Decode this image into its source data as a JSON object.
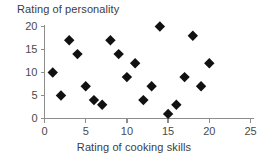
{
  "chart_data": {
    "type": "scatter",
    "title": "",
    "xlabel": "Rating of cooking skills",
    "ylabel": "Rating of personality",
    "xlim": [
      0,
      25
    ],
    "ylim": [
      0,
      20
    ],
    "xticks": [
      0,
      5,
      10,
      15,
      20,
      25
    ],
    "yticks": [
      0,
      5,
      10,
      15,
      20
    ],
    "grid": false,
    "legend": false,
    "marker": "diamond",
    "marker_color": "#111111",
    "axis_color": "#8d8d8d",
    "points": [
      {
        "x": 1,
        "y": 10
      },
      {
        "x": 2,
        "y": 5
      },
      {
        "x": 3,
        "y": 17
      },
      {
        "x": 4,
        "y": 14
      },
      {
        "x": 5,
        "y": 7
      },
      {
        "x": 6,
        "y": 4
      },
      {
        "x": 7,
        "y": 3
      },
      {
        "x": 8,
        "y": 17
      },
      {
        "x": 9,
        "y": 14
      },
      {
        "x": 10,
        "y": 9
      },
      {
        "x": 11,
        "y": 12
      },
      {
        "x": 12,
        "y": 4
      },
      {
        "x": 13,
        "y": 7
      },
      {
        "x": 14,
        "y": 20
      },
      {
        "x": 15,
        "y": 1
      },
      {
        "x": 16,
        "y": 3
      },
      {
        "x": 17,
        "y": 9
      },
      {
        "x": 18,
        "y": 18
      },
      {
        "x": 19,
        "y": 7
      },
      {
        "x": 20,
        "y": 12
      }
    ]
  },
  "labels": {
    "y_axis_title": "Rating of personality",
    "x_axis_title": "Rating of cooking skills",
    "y_ticks": [
      "0",
      "5",
      "10",
      "15",
      "20"
    ],
    "x_ticks": [
      "0",
      "5",
      "10",
      "15",
      "20",
      "25"
    ]
  }
}
